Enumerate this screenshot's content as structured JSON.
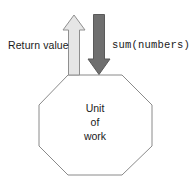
{
  "diagram": {
    "type": "flow-diagram",
    "background_color": "#ffffff",
    "labels": {
      "return_value": "Return value",
      "sum_numbers": "sum(numbers)"
    },
    "node": {
      "name": "unit-of-work",
      "shape": "octagon",
      "line1": "Unit",
      "line2": "of",
      "line3": "work",
      "stroke_color": "#8a8a8a",
      "fill_color": "#ffffff"
    },
    "arrows": [
      {
        "name": "return-value-arrow",
        "direction": "up",
        "fill_color": "#e6e6e6",
        "stroke_color": "#8f8f8f",
        "label": "Return value"
      },
      {
        "name": "sum-numbers-arrow",
        "direction": "down",
        "fill_color": "#6f6f6f",
        "stroke_color": "#5a5a5a",
        "label": "sum(numbers)"
      }
    ]
  }
}
